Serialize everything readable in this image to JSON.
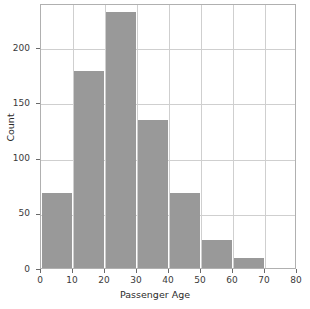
{
  "chart_data": {
    "type": "bar",
    "title": "",
    "subtitle": "",
    "xlabel": "Passenger Age",
    "ylabel": "Count",
    "categories": [
      "0-10",
      "10-20",
      "20-30",
      "30-40",
      "40-50",
      "50-60",
      "60-70",
      "70-80"
    ],
    "bin_edges": [
      0,
      10,
      20,
      30,
      40,
      50,
      60,
      70,
      80
    ],
    "values": [
      68,
      178,
      232,
      134,
      68,
      25,
      9,
      0
    ],
    "series": [
      {
        "name": "Count",
        "values": [
          68,
          178,
          232,
          134,
          68,
          25,
          9,
          0
        ]
      }
    ],
    "bars": [
      {
        "bin": "0-10",
        "x0": 0,
        "x1": 10,
        "value": 68
      },
      {
        "bin": "10-20",
        "x0": 10,
        "x1": 20,
        "value": 178
      },
      {
        "bin": "20-30",
        "x0": 20,
        "x1": 30,
        "value": 232
      },
      {
        "bin": "30-40",
        "x0": 30,
        "x1": 40,
        "value": 134
      },
      {
        "bin": "40-50",
        "x0": 40,
        "x1": 50,
        "value": 68
      },
      {
        "bin": "50-60",
        "x0": 50,
        "x1": 60,
        "value": 25
      },
      {
        "bin": "60-70",
        "x0": 60,
        "x1": 70,
        "value": 9
      },
      {
        "bin": "70-80",
        "x0": 70,
        "x1": 80,
        "value": 0
      }
    ],
    "xticks": [
      0,
      10,
      20,
      30,
      40,
      50,
      60,
      70,
      80
    ],
    "xtick_labels": [
      "0",
      "10",
      "20",
      "30",
      "40",
      "50",
      "60",
      "70",
      "80"
    ],
    "yticks": [
      0,
      50,
      100,
      150,
      200
    ],
    "ytick_labels": [
      "0",
      "50",
      "100",
      "150",
      "200"
    ],
    "xlim": [
      0,
      80
    ],
    "ylim": [
      0,
      240
    ],
    "grid": true,
    "legend": false,
    "legend_position": "none",
    "bar_color": "#999999",
    "grid_color": "#cfcfcf",
    "frame_color": "#b0b0b0",
    "background": "#ffffff"
  }
}
